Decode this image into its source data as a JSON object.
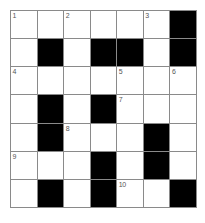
{
  "puzzle": {
    "type": "crossword-grid",
    "title": "Crossword Puzzle Grid",
    "rows": 7,
    "cols": 7,
    "colors": {
      "block": "#000000",
      "open": "#ffffff",
      "grid_line": "#8a8a8a",
      "number_text": "#555555",
      "page_background": "#ffffff"
    },
    "grid": [
      [
        {
          "block": false,
          "number": "1"
        },
        {
          "block": false,
          "number": ""
        },
        {
          "block": false,
          "number": "2"
        },
        {
          "block": false,
          "number": ""
        },
        {
          "block": false,
          "number": ""
        },
        {
          "block": false,
          "number": "3"
        },
        {
          "block": true,
          "number": ""
        }
      ],
      [
        {
          "block": false,
          "number": ""
        },
        {
          "block": true,
          "number": ""
        },
        {
          "block": false,
          "number": ""
        },
        {
          "block": true,
          "number": ""
        },
        {
          "block": true,
          "number": ""
        },
        {
          "block": false,
          "number": ""
        },
        {
          "block": true,
          "number": ""
        }
      ],
      [
        {
          "block": false,
          "number": "4"
        },
        {
          "block": false,
          "number": ""
        },
        {
          "block": false,
          "number": ""
        },
        {
          "block": false,
          "number": ""
        },
        {
          "block": false,
          "number": "5"
        },
        {
          "block": false,
          "number": ""
        },
        {
          "block": false,
          "number": "6"
        }
      ],
      [
        {
          "block": false,
          "number": ""
        },
        {
          "block": true,
          "number": ""
        },
        {
          "block": false,
          "number": ""
        },
        {
          "block": true,
          "number": ""
        },
        {
          "block": false,
          "number": "7"
        },
        {
          "block": false,
          "number": ""
        },
        {
          "block": false,
          "number": ""
        }
      ],
      [
        {
          "block": false,
          "number": ""
        },
        {
          "block": true,
          "number": ""
        },
        {
          "block": false,
          "number": "8"
        },
        {
          "block": false,
          "number": ""
        },
        {
          "block": false,
          "number": ""
        },
        {
          "block": true,
          "number": ""
        },
        {
          "block": false,
          "number": ""
        }
      ],
      [
        {
          "block": false,
          "number": "9"
        },
        {
          "block": false,
          "number": ""
        },
        {
          "block": false,
          "number": ""
        },
        {
          "block": true,
          "number": ""
        },
        {
          "block": false,
          "number": ""
        },
        {
          "block": true,
          "number": ""
        },
        {
          "block": false,
          "number": ""
        }
      ],
      [
        {
          "block": false,
          "number": ""
        },
        {
          "block": true,
          "number": ""
        },
        {
          "block": false,
          "number": ""
        },
        {
          "block": true,
          "number": ""
        },
        {
          "block": false,
          "number": "10"
        },
        {
          "block": false,
          "number": ""
        },
        {
          "block": true,
          "number": ""
        }
      ]
    ],
    "clue_numbers": [
      "1",
      "2",
      "3",
      "4",
      "5",
      "6",
      "7",
      "8",
      "9",
      "10"
    ]
  }
}
